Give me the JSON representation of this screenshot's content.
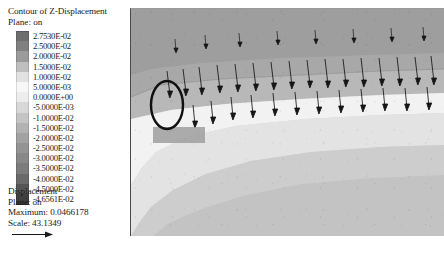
{
  "legend": {
    "title": "Contour of Z-Displacement",
    "plane_label": "Plane: on",
    "entries": [
      {
        "value": "2.7530E-02",
        "color": "#6e6e6e"
      },
      {
        "value": "2.5000E-02",
        "color": "#808080"
      },
      {
        "value": "2.0000E-02",
        "color": "#9b9b9b"
      },
      {
        "value": "1.5000E-02",
        "color": "#bfbfbf"
      },
      {
        "value": "1.0000E-02",
        "color": "#e2e2e2"
      },
      {
        "value": "5.0000E-03",
        "color": "#f7f7f7"
      },
      {
        "value": "0.0000E+00",
        "color": "#ededed"
      },
      {
        "value": "-5.0000E-03",
        "color": "#d8d8d8"
      },
      {
        "value": "-1.0000E-02",
        "color": "#c4c4c4"
      },
      {
        "value": "-1.5000E-02",
        "color": "#b2b2b2"
      },
      {
        "value": "-2.0000E-02",
        "color": "#a2a2a2"
      },
      {
        "value": "-2.5000E-02",
        "color": "#949494"
      },
      {
        "value": "-3.0000E-02",
        "color": "#888888"
      },
      {
        "value": "-3.5000E-02",
        "color": "#7c7c7c"
      },
      {
        "value": "-4.0000E-02",
        "color": "#6a6a6a"
      },
      {
        "value": "-4.5000E-02",
        "color": "#555555"
      },
      {
        "value": "-4.6561E-02",
        "color": "#3f3f3f"
      }
    ],
    "footer": {
      "quantity": "Displacement",
      "plane_label": "Plane: on",
      "maximum": "Maximum: 0.0466178",
      "scale": "Scale: 43.1349"
    }
  },
  "chart_data": {
    "type": "heatmap",
    "title": "Contour of Z-Displacement",
    "subtitle": "Plane: on",
    "colormap": "grayscale",
    "grid": false,
    "legend_position": "left",
    "xlabel": "",
    "ylabel": "",
    "units": "m",
    "levels": [
      0.02753,
      0.025,
      0.02,
      0.015,
      0.01,
      0.005,
      0.0,
      -0.005,
      -0.01,
      -0.015,
      -0.02,
      -0.025,
      -0.03,
      -0.035,
      -0.04,
      -0.045,
      -0.046561
    ],
    "level_labels": [
      "2.7530E-02",
      "2.5000E-02",
      "2.0000E-02",
      "1.5000E-02",
      "1.0000E-02",
      "5.0000E-03",
      "0.0000E+00",
      "-5.0000E-03",
      "-1.0000E-02",
      "-1.5000E-02",
      "-2.0000E-02",
      "-2.5000E-02",
      "-3.0000E-02",
      "-3.5000E-02",
      "-4.0000E-02",
      "-4.5000E-02",
      "-4.6561E-02"
    ],
    "zmin": -0.046561,
    "zmax": 0.02753,
    "vector_field": {
      "name": "Displacement",
      "plane": "on",
      "maximum": 0.0466178,
      "scale": 43.1349,
      "direction": "downward"
    },
    "annotation": {
      "type": "ellipse",
      "label": "region-of-interest"
    }
  }
}
